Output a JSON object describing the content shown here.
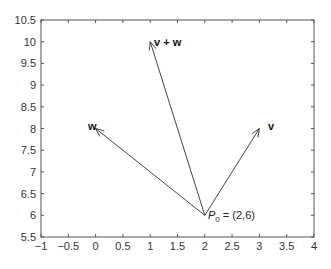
{
  "chart_data": {
    "type": "line",
    "title": "",
    "xlabel": "",
    "ylabel": "",
    "xlim": [
      -1,
      4
    ],
    "ylim": [
      5.5,
      10.5
    ],
    "grid": false,
    "x_ticks": [
      "-1",
      "-0.5",
      "0",
      "0.5",
      "1",
      "1.5",
      "2",
      "2.5",
      "3",
      "3.5",
      "4"
    ],
    "y_ticks": [
      "5.5",
      "6",
      "6.5",
      "7",
      "7.5",
      "8",
      "8.5",
      "9",
      "9.5",
      "10",
      "10.5"
    ],
    "origin": {
      "label": "P0 = (2,6)",
      "x": 2,
      "y": 6
    },
    "series": [
      {
        "name": "v",
        "from": [
          2,
          6
        ],
        "to": [
          3,
          8
        ]
      },
      {
        "name": "w",
        "from": [
          2,
          6
        ],
        "to": [
          0,
          8
        ]
      },
      {
        "name": "v + w",
        "from": [
          2,
          6
        ],
        "to": [
          1,
          10
        ]
      }
    ]
  },
  "labels": {
    "v": "v",
    "w": "w",
    "v_plus_w": "v + w",
    "p0_main": "P",
    "p0_sub": "0",
    "p0_rest": " = (2,6)"
  },
  "colors": {
    "axis": "#555555",
    "vector": "#444444",
    "text": "#222222"
  }
}
